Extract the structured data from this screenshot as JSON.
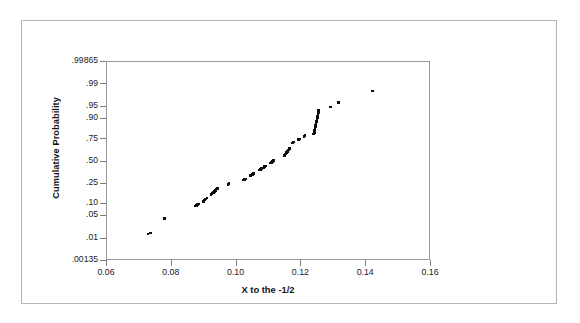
{
  "chart_data": {
    "type": "scatter",
    "title": "",
    "subtitle": "",
    "xlabel": "X to the -1/2",
    "ylabel": "Cumulative Probability",
    "plot_kind": "normal-probability-plot",
    "grid": false,
    "legend": null,
    "background": "#ffffff",
    "point_color": "#0d0d0d",
    "frame_color": "#9a9a9a",
    "outer_border_color": "#b6b6b6",
    "xlim": [
      0.06,
      0.16
    ],
    "x_ticks": [
      0.06,
      0.08,
      0.1,
      0.12,
      0.14,
      0.16
    ],
    "x_tick_labels": [
      "0.06",
      "0.08",
      "0.10",
      "0.12",
      "0.14",
      "0.16"
    ],
    "y_scale": "probit",
    "ylim": [
      0.00135,
      0.99865
    ],
    "y_ticks": [
      0.00135,
      0.01,
      0.05,
      0.1,
      0.25,
      0.5,
      0.75,
      0.9,
      0.95,
      0.99,
      0.99865
    ],
    "y_tick_labels": [
      ".00135",
      ".01",
      ".05",
      ".10",
      ".25",
      ".50",
      ".75",
      ".90",
      ".95",
      ".99",
      ".99865"
    ],
    "x": [
      0.0727,
      0.0734,
      0.0778,
      0.0874,
      0.0876,
      0.0879,
      0.0882,
      0.0898,
      0.09,
      0.0903,
      0.0906,
      0.0909,
      0.0921,
      0.0923,
      0.0925,
      0.0928,
      0.0931,
      0.0934,
      0.0936,
      0.0938,
      0.0941,
      0.0973,
      0.0975,
      0.0977,
      0.102,
      0.1023,
      0.1026,
      0.1029,
      0.1043,
      0.1046,
      0.1049,
      0.1052,
      0.107,
      0.1073,
      0.1076,
      0.1084,
      0.1087,
      0.109,
      0.1105,
      0.1108,
      0.1111,
      0.1114,
      0.1148,
      0.1151,
      0.1154,
      0.1157,
      0.116,
      0.1163,
      0.1172,
      0.1175,
      0.1191,
      0.1194,
      0.1208,
      0.1211,
      0.1238,
      0.124,
      0.1241,
      0.1242,
      0.1243,
      0.1244,
      0.1245,
      0.1246,
      0.1247,
      0.1248,
      0.1249,
      0.125,
      0.1251,
      0.1252,
      0.1253,
      0.129,
      0.1315,
      0.1419
    ],
    "y": [
      0.0145,
      0.0155,
      0.043,
      0.09,
      0.093,
      0.096,
      0.099,
      0.115,
      0.12,
      0.125,
      0.13,
      0.135,
      0.16,
      0.165,
      0.17,
      0.176,
      0.182,
      0.19,
      0.196,
      0.202,
      0.208,
      0.245,
      0.248,
      0.251,
      0.287,
      0.291,
      0.295,
      0.299,
      0.335,
      0.342,
      0.349,
      0.356,
      0.4,
      0.408,
      0.416,
      0.43,
      0.438,
      0.445,
      0.48,
      0.49,
      0.5,
      0.51,
      0.575,
      0.59,
      0.605,
      0.62,
      0.635,
      0.65,
      0.71,
      0.72,
      0.745,
      0.753,
      0.775,
      0.785,
      0.795,
      0.81,
      0.825,
      0.838,
      0.85,
      0.862,
      0.872,
      0.882,
      0.89,
      0.898,
      0.905,
      0.912,
      0.92,
      0.928,
      0.938,
      0.95,
      0.962,
      0.983
    ],
    "n_points": 73
  },
  "axes": {
    "y_axis_title": "Cumulative Probability",
    "x_axis_title": "X to the -1/2"
  }
}
